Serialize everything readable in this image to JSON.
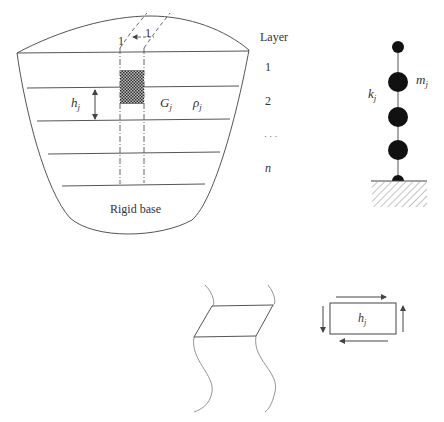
{
  "figure": {
    "soil_profile": {
      "column_labels": {
        "width": "1",
        "depth": "1"
      },
      "layer_thickness_label": "h",
      "layer_thickness_sub": "j",
      "shear_modulus_label": "G",
      "shear_modulus_sub": "j",
      "density_label": "ρ",
      "density_sub": "j",
      "base_label": "Rigid base"
    },
    "layer_legend": {
      "title": "Layer",
      "items": [
        "1",
        "2",
        "· · ·",
        "n"
      ]
    },
    "lumped_mass_model": {
      "mass_label": "m",
      "mass_sub": "j",
      "stiffness_label": "k",
      "stiffness_sub": "j",
      "mass_count": 4
    },
    "shear_element": {
      "height_label": "h",
      "height_sub": "j"
    },
    "colors": {
      "line": "#555555",
      "mass": "#111111",
      "hatch": "#888888",
      "text": "#333333"
    }
  }
}
